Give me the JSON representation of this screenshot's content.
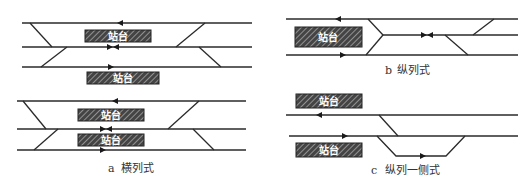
{
  "platform_label": "站台",
  "diagrams": {
    "a": {
      "letter": "a",
      "caption": "横列式"
    },
    "b": {
      "letter": "b",
      "caption": "纵列式"
    },
    "c": {
      "letter": "c",
      "caption": "纵列一侧式"
    }
  },
  "colors": {
    "track": "#2a2a2a",
    "platform_fill": "#555555",
    "background": "#ffffff"
  }
}
